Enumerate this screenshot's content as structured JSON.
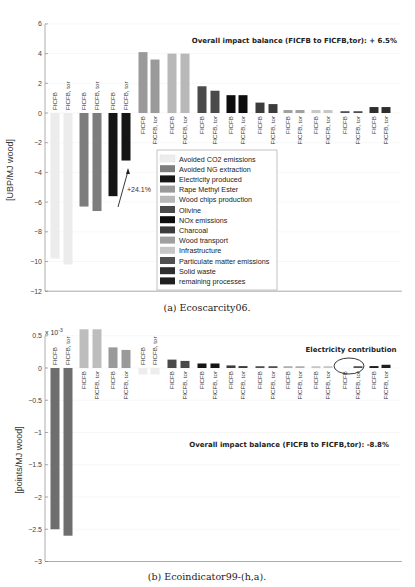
{
  "chart_data": [
    {
      "type": "bar",
      "title": "",
      "caption": "(a) Ecoscarcity06.",
      "ylabel": "[UBP/MJ wood]",
      "xlabel": "",
      "ylim": [
        -12,
        6
      ],
      "yticks": [
        6,
        4,
        2,
        0,
        -2,
        -4,
        -6,
        -8,
        -10,
        -12
      ],
      "grid": true,
      "annotation": "Overall impact balance (FICFB to FICFB,tor): + 6.5%",
      "arrow_annotation": "+24.1%",
      "legend_position": "inside lower middle",
      "categories": [
        "FICFB",
        "FICFB, tor"
      ],
      "series": [
        {
          "name": "Avoided CO2 emissions",
          "color": "#ececec",
          "values": [
            -9.8,
            -10.2
          ]
        },
        {
          "name": "Avoided NG extraction",
          "color": "#7d7d7d",
          "values": [
            -6.3,
            -6.6
          ]
        },
        {
          "name": "Electricity produced",
          "color": "#151515",
          "values": [
            -5.6,
            -3.2
          ]
        },
        {
          "name": "Rape Methyl Ester",
          "color": "#9a9a9a",
          "values": [
            4.1,
            3.6
          ]
        },
        {
          "name": "Wood chips production",
          "color": "#b8b8b8",
          "values": [
            4.0,
            4.0
          ]
        },
        {
          "name": "Olivine",
          "color": "#4a4a4a",
          "values": [
            1.8,
            1.5
          ]
        },
        {
          "name": "NOx emissions",
          "color": "#0d0d0d",
          "values": [
            1.2,
            1.2
          ]
        },
        {
          "name": "Charcoal",
          "color": "#3c3c3c",
          "values": [
            0.7,
            0.6
          ]
        },
        {
          "name": "Wood transport",
          "color": "#a0a0a0",
          "values": [
            0.2,
            0.2
          ]
        },
        {
          "name": "Infrastructure",
          "color": "#c6c6c6",
          "values": [
            0.2,
            0.2
          ]
        },
        {
          "name": "Particulate matter emissions",
          "color": "#505050",
          "values": [
            0.1,
            0.1
          ]
        },
        {
          "name": "Solid waste",
          "color": "#2e2e2e",
          "values": [
            0.4,
            0.4
          ]
        },
        {
          "name": "remaining processes",
          "color": "#1f1f1f",
          "values": [
            0.0,
            0.0
          ]
        }
      ]
    },
    {
      "type": "bar",
      "title": "",
      "caption": "(b) Ecoindicator99-(h,a).",
      "ylabel": "[points/MJ wood]",
      "xlabel": "",
      "scale_label": "x 10",
      "scale_exponent": "-3",
      "ylim": [
        -3,
        0.5
      ],
      "yticks": [
        0.5,
        0,
        -0.5,
        -1,
        -1.5,
        -2,
        -2.5,
        -3
      ],
      "grid": true,
      "annotation": "Overall impact balance (FICFB to FICFB,tor): -8.8%",
      "callout": "Electricity contribution",
      "categories": [
        "FICFB",
        "FICFB, tor"
      ],
      "series": [
        {
          "name": "Avoided NG extraction",
          "color": "#6e6e6e",
          "values": [
            -2.5,
            -2.6
          ]
        },
        {
          "name": "Wood chips production",
          "color": "#bdbdbd",
          "values": [
            0.6,
            0.6
          ]
        },
        {
          "name": "Rape Methyl Ester",
          "color": "#9a9a9a",
          "values": [
            0.32,
            0.28
          ]
        },
        {
          "name": "Avoided CO2 emissions",
          "color": "#ededed",
          "values": [
            -0.1,
            -0.1
          ]
        },
        {
          "name": "Olivine",
          "color": "#4a4a4a",
          "values": [
            0.13,
            0.11
          ]
        },
        {
          "name": "NOx emissions",
          "color": "#151515",
          "values": [
            0.07,
            0.07
          ]
        },
        {
          "name": "Charcoal",
          "color": "#3c3c3c",
          "values": [
            0.04,
            0.03
          ]
        },
        {
          "name": "Particulate matter emissions",
          "color": "#505050",
          "values": [
            0.02,
            0.02
          ]
        },
        {
          "name": "Wood transport",
          "color": "#b0b0b0",
          "values": [
            0.01,
            0.01
          ]
        },
        {
          "name": "Infrastructure",
          "color": "#c6c6c6",
          "values": [
            0.01,
            0.01
          ]
        },
        {
          "name": "Electricity produced",
          "color": "#555555",
          "values": [
            0.0,
            0.01
          ]
        },
        {
          "name": "Solid waste",
          "color": "#1f1f1f",
          "values": [
            0.03,
            0.05
          ]
        }
      ]
    }
  ],
  "text": {
    "chart1_annotation": "Overall impact balance (FICFB to FICFB,tor): + 6.5%",
    "chart1_arrow": "+24.1%",
    "chart1_ylabel": "[UBP/MJ wood]",
    "chart1_caption": "(a) Ecoscarcity06.",
    "chart2_annotation": "Overall impact balance (FICFB to FICFB,tor): -8.8%",
    "chart2_callout": "Electricity contribution",
    "chart2_ylabel": "[points/MJ wood]",
    "chart2_caption": "(b) Ecoindicator99-(h,a).",
    "chart2_scale": "x 10",
    "chart2_exp": "-3",
    "bar_label_a": "FICFB",
    "bar_label_b": "FICFB, tor"
  }
}
